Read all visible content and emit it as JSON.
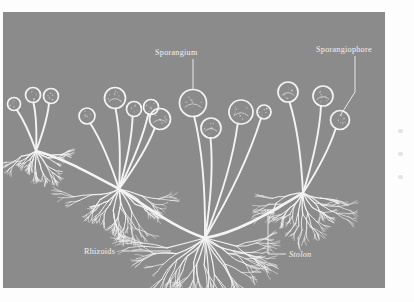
{
  "figure": {
    "background_color": "#8b8b8b",
    "ink_color": "#f4f4f4",
    "page_color": "#ffffff",
    "plate": {
      "x": 3,
      "y": 12,
      "width": 382,
      "height": 276
    }
  },
  "labels": {
    "sporangium": "Sporangium",
    "sporangiophore": "Sporangiophore",
    "rhizoids": "Rhizoids",
    "stolon": "Stolon"
  },
  "label_positions": {
    "sporangium": {
      "x": 152,
      "y": 43,
      "anchor": "start"
    },
    "sporangiophore": {
      "x": 313,
      "y": 40,
      "anchor": "start"
    },
    "rhizoids": {
      "x": 81,
      "y": 242,
      "anchor": "start"
    },
    "stolon": {
      "x": 286,
      "y": 245,
      "anchor": "start"
    }
  },
  "leaders": {
    "sporangium": "M 190 47 L 190 78",
    "sporangiophore": "M 352 44 L 352 80 L 337 104",
    "rhizoids": "M 119 239 L 168 239",
    "stolon": "M 265 197 L 265 242 L 283 242"
  },
  "nodes": [
    {
      "name": "node-left",
      "x": 33,
      "y": 139
    },
    {
      "name": "node-left-center",
      "x": 116,
      "y": 177
    },
    {
      "name": "node-center",
      "x": 202,
      "y": 226
    },
    {
      "name": "node-right",
      "x": 300,
      "y": 181
    }
  ],
  "stolons": [
    {
      "name": "stolon-left",
      "d": "M 33 139 C 60 146, 88 162, 116 177"
    },
    {
      "name": "stolon-mid",
      "d": "M 116 177 C 148 197, 172 216, 202 226"
    },
    {
      "name": "stolon-right",
      "d": "M 202 226 C 234 221, 268 200, 300 181"
    }
  ],
  "sporangiophores": [
    {
      "node": 0,
      "tip_x": 11,
      "tip_y": 92,
      "r": 6.5
    },
    {
      "node": 0,
      "tip_x": 30,
      "tip_y": 83,
      "r": 7.5
    },
    {
      "node": 0,
      "tip_x": 48,
      "tip_y": 84,
      "r": 7.5
    },
    {
      "node": 1,
      "tip_x": 84,
      "tip_y": 104,
      "r": 8.0
    },
    {
      "node": 1,
      "tip_x": 112,
      "tip_y": 86,
      "r": 10.5
    },
    {
      "node": 1,
      "tip_x": 131,
      "tip_y": 97,
      "r": 7.5
    },
    {
      "node": 1,
      "tip_x": 148,
      "tip_y": 95,
      "r": 7.5
    },
    {
      "node": 1,
      "tip_x": 157,
      "tip_y": 107,
      "r": 10.5
    },
    {
      "node": 2,
      "tip_x": 190,
      "tip_y": 91,
      "r": 13.5
    },
    {
      "node": 2,
      "tip_x": 208,
      "tip_y": 116,
      "r": 10.0
    },
    {
      "node": 2,
      "tip_x": 238,
      "tip_y": 100,
      "r": 12.0
    },
    {
      "node": 2,
      "tip_x": 261,
      "tip_y": 100,
      "r": 7.0
    },
    {
      "node": 3,
      "tip_x": 285,
      "tip_y": 80,
      "r": 10.0
    },
    {
      "node": 3,
      "tip_x": 320,
      "tip_y": 84,
      "r": 10.0
    },
    {
      "node": 3,
      "tip_x": 337,
      "tip_y": 108,
      "r": 9.5
    }
  ],
  "rhizoid_clusters": [
    {
      "node": 0,
      "spread": 26,
      "depth": 22
    },
    {
      "node": 1,
      "spread": 48,
      "depth": 36
    },
    {
      "node": 2,
      "spread": 72,
      "depth": 52
    },
    {
      "node": 3,
      "spread": 44,
      "depth": 34
    }
  ]
}
